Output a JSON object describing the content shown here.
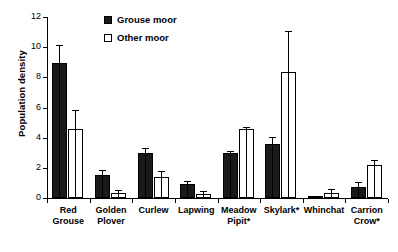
{
  "chart_data": {
    "type": "bar",
    "title": "",
    "xlabel": "",
    "ylabel": "Population density",
    "ylim": [
      0,
      12
    ],
    "yticks": [
      0,
      2,
      4,
      6,
      8,
      10,
      12
    ],
    "grid": false,
    "legend_position": "top-left-inside",
    "categories": [
      "Red Grouse",
      "Golden Plover",
      "Curlew",
      "Lapwing",
      "Meadow Pipit*",
      "Skylark*",
      "Whinchat",
      "Carrion Crow*"
    ],
    "category_lines": [
      [
        "Red",
        "Grouse"
      ],
      [
        "Golden",
        "Plover"
      ],
      [
        "Curlew",
        ""
      ],
      [
        "Lapwing",
        ""
      ],
      [
        "Meadow",
        "Pipit*"
      ],
      [
        "Skylark*",
        ""
      ],
      [
        "Whinchat",
        ""
      ],
      [
        "Carrion",
        "Crow*"
      ]
    ],
    "series": [
      {
        "name": "Grouse moor",
        "color": "#1a1a1a",
        "style": "filled",
        "values": [
          8.95,
          1.5,
          3.0,
          0.9,
          3.0,
          3.6,
          0.05,
          0.75
        ],
        "errors_upper": [
          10.1,
          1.8,
          3.25,
          1.05,
          3.05,
          4.0,
          0.1,
          1.0
        ]
      },
      {
        "name": "Other moor",
        "color": "#ffffff",
        "style": "open",
        "values": [
          4.6,
          0.3,
          1.4,
          0.25,
          4.6,
          8.35,
          0.35,
          2.2
        ],
        "errors_upper": [
          5.8,
          0.45,
          1.75,
          0.4,
          4.65,
          11.0,
          0.5,
          2.45
        ]
      }
    ]
  },
  "legend": {
    "items": [
      {
        "label": "Grouse moor",
        "style": "filled"
      },
      {
        "label": "Other moor",
        "style": "open"
      }
    ]
  }
}
